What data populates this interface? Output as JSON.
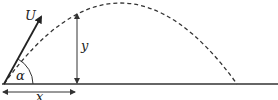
{
  "diagram": {
    "labels": {
      "velocity": "U",
      "angle": "α",
      "height": "y",
      "distance": "x"
    },
    "colors": {
      "stroke": "#333333",
      "background": "#ffffff"
    }
  }
}
